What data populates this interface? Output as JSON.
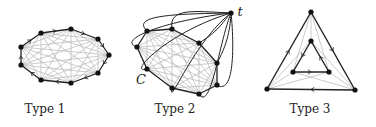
{
  "figures": [
    {
      "id": "type1",
      "caption": "Type 1",
      "caption_pos": [
        45,
        113
      ],
      "cycle": [
        [
          41,
          33
        ],
        [
          71,
          29
        ],
        [
          98,
          39
        ],
        [
          109,
          55
        ],
        [
          98,
          73
        ],
        [
          71,
          83
        ],
        [
          41,
          80
        ],
        [
          21,
          65
        ],
        [
          21,
          47
        ]
      ],
      "chords_all_pairs": true
    },
    {
      "id": "type2",
      "caption": "Type 2",
      "caption_pos": [
        175,
        113
      ],
      "cycle_label": "C",
      "cycle_label_pos": [
        141,
        84
      ],
      "apex_label": "t",
      "apex_label_pos": [
        240,
        16
      ],
      "apex": [
        231,
        13
      ],
      "cycle": [
        [
          147,
          31
        ],
        [
          172,
          29
        ],
        [
          199,
          43
        ],
        [
          217,
          63
        ],
        [
          217,
          85
        ],
        [
          199,
          94
        ],
        [
          172,
          88
        ],
        [
          147,
          69
        ],
        [
          137,
          47
        ]
      ],
      "chords_all_pairs": true
    },
    {
      "id": "type3",
      "caption": "Type 3",
      "caption_pos": [
        310,
        113
      ],
      "outer": [
        [
          311,
          12
        ],
        [
          355,
          90
        ],
        [
          267,
          89
        ]
      ],
      "inner": [
        [
          311,
          41
        ],
        [
          329,
          72
        ],
        [
          293,
          72
        ]
      ]
    }
  ],
  "colors": {
    "edge": "#222222",
    "chord": "#b5b5b5",
    "node": "#111111",
    "text": "#222222"
  }
}
